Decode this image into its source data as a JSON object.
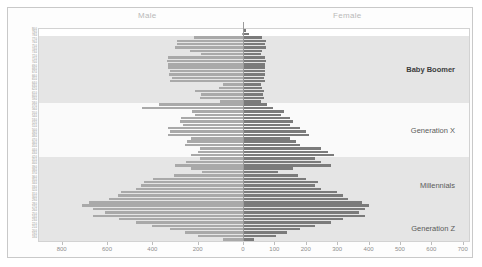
{
  "header": {
    "male_label": "Male",
    "female_label": "Female"
  },
  "colors": {
    "male_bar": "#a9a9a9",
    "female_bar": "#7b7b7b",
    "band_shade": "#dcdcdc",
    "band_light": "#f4f4f4",
    "axis": "#bdbdbd",
    "zero_line": "#9b9b9b"
  },
  "chart_data": {
    "type": "bar",
    "subtype": "population-pyramid",
    "title": "",
    "xlabel": "",
    "ylabel": "",
    "grid": false,
    "legend_position": "top",
    "axis_left_ticks": [
      800,
      600,
      400,
      200,
      0
    ],
    "axis_right_ticks": [
      0,
      100,
      200,
      300,
      400,
      500,
      600,
      700
    ],
    "xlim_male": [
      0,
      900
    ],
    "xlim_female": [
      0,
      720
    ],
    "ages": [
      80,
      79,
      78,
      77,
      76,
      75,
      74,
      73,
      72,
      71,
      70,
      69,
      68,
      67,
      66,
      65,
      64,
      63,
      62,
      61,
      60,
      59,
      58,
      57,
      56,
      55,
      54,
      53,
      52,
      51,
      50,
      49,
      48,
      47,
      46,
      45,
      44,
      43,
      42,
      41,
      40,
      39,
      38,
      37,
      36,
      35,
      34,
      33,
      32,
      31,
      30,
      29,
      28,
      27,
      26,
      25,
      24,
      23,
      22,
      21,
      20,
      19,
      18
    ],
    "series": [
      {
        "name": "Male",
        "side": "left",
        "values": [
          0,
          6,
          215,
          290,
          290,
          300,
          235,
          185,
          330,
          335,
          330,
          330,
          320,
          325,
          315,
          320,
          90,
          105,
          210,
          185,
          190,
          100,
          370,
          445,
          225,
          210,
          275,
          280,
          265,
          330,
          320,
          330,
          230,
          245,
          255,
          190,
          200,
          230,
          190,
          250,
          300,
          230,
          180,
          305,
          395,
          435,
          450,
          470,
          540,
          550,
          590,
          680,
          710,
          660,
          610,
          660,
          545,
          470,
          400,
          320,
          255,
          200,
          90
        ]
      },
      {
        "name": "Female",
        "side": "right",
        "values": [
          10,
          18,
          60,
          72,
          70,
          72,
          60,
          58,
          70,
          72,
          70,
          70,
          70,
          70,
          68,
          70,
          58,
          60,
          68,
          65,
          66,
          58,
          78,
          95,
          130,
          120,
          150,
          160,
          150,
          180,
          200,
          210,
          150,
          170,
          180,
          250,
          270,
          290,
          230,
          250,
          280,
          160,
          110,
          175,
          200,
          240,
          230,
          250,
          300,
          320,
          335,
          380,
          400,
          390,
          370,
          390,
          320,
          280,
          230,
          180,
          140,
          105,
          35
        ]
      }
    ],
    "generation_bands": [
      {
        "label": "Baby Boomer",
        "age_start": 78,
        "age_end": 59,
        "shaded": true,
        "bold": true
      },
      {
        "label": "Generation X",
        "age_start": 58,
        "age_end": 43,
        "shaded": false,
        "bold": false
      },
      {
        "label": "Millennials",
        "age_start": 42,
        "age_end": 26,
        "shaded": true,
        "bold": false
      },
      {
        "label": "Generation Z",
        "age_start": 25,
        "age_end": 18,
        "shaded": true,
        "bold": false
      }
    ]
  }
}
